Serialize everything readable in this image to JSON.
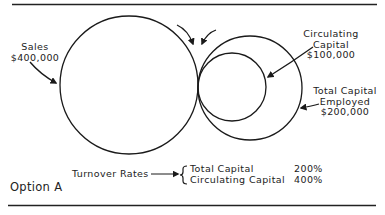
{
  "figure": {
    "option_label": "Option A",
    "sales": {
      "label": "Sales",
      "value": "$400,000"
    },
    "circulating_capital": {
      "label_line1": "Circulating",
      "label_line2": "Capital",
      "value": "$100,000"
    },
    "total_capital_employed": {
      "label_line1": "Total Capital",
      "label_line2": "Employed",
      "value": "$200,000"
    },
    "turnover": {
      "label": "Turnover Rates",
      "rows": [
        {
          "name": "Total Capital",
          "rate": "200%"
        },
        {
          "name": "Circulating Capital",
          "rate": "400%"
        }
      ]
    }
  }
}
